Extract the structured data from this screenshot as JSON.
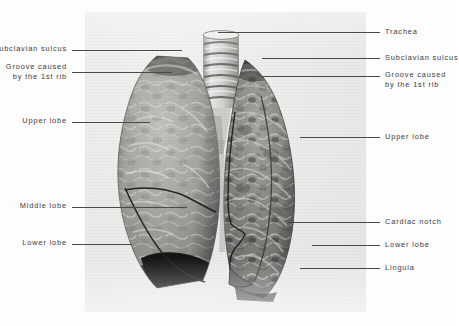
{
  "figure": {
    "plate_type": "grayscale-photograph"
  },
  "colors": {
    "paper": "#fdfdfd",
    "plate_background": "#ebebe8",
    "label_text": "#3a3a3a",
    "leader_line": "#4a4a4a",
    "lung_light": "#b9b9b5",
    "lung_dark": "#6f6f6c",
    "shadow_black": "#101010"
  },
  "labels": {
    "left": [
      {
        "name": "subclavian-sulcus",
        "text": "Subclavian sulcus"
      },
      {
        "name": "groove-caused-by-1st-rib",
        "text": "Groove caused\nby the 1st rib"
      },
      {
        "name": "upper-lobe",
        "text": "Upper lobe"
      },
      {
        "name": "middle-lobe",
        "text": "Middle lobe"
      },
      {
        "name": "lower-lobe",
        "text": "Lower lobe"
      }
    ],
    "right": [
      {
        "name": "trachea",
        "text": "Trachea"
      },
      {
        "name": "subclavian-sulcus",
        "text": "Subclavian sulcus"
      },
      {
        "name": "groove-caused-by-1st-rib",
        "text": "Groove caused\nby the 1st rib"
      },
      {
        "name": "upper-lobe",
        "text": "Upper lobe"
      },
      {
        "name": "cardiac-notch",
        "text": "Cardiac notch"
      },
      {
        "name": "lower-lobe",
        "text": "Lower lobe"
      },
      {
        "name": "lingula",
        "text": "Lingula"
      }
    ]
  },
  "structures": {
    "trachea": "trachea-with-cartilage-rings",
    "right_lung": "right-lung-three-lobes",
    "left_lung": "left-lung-two-lobes",
    "fissures": [
      "oblique-fissure",
      "horizontal-fissure"
    ]
  }
}
